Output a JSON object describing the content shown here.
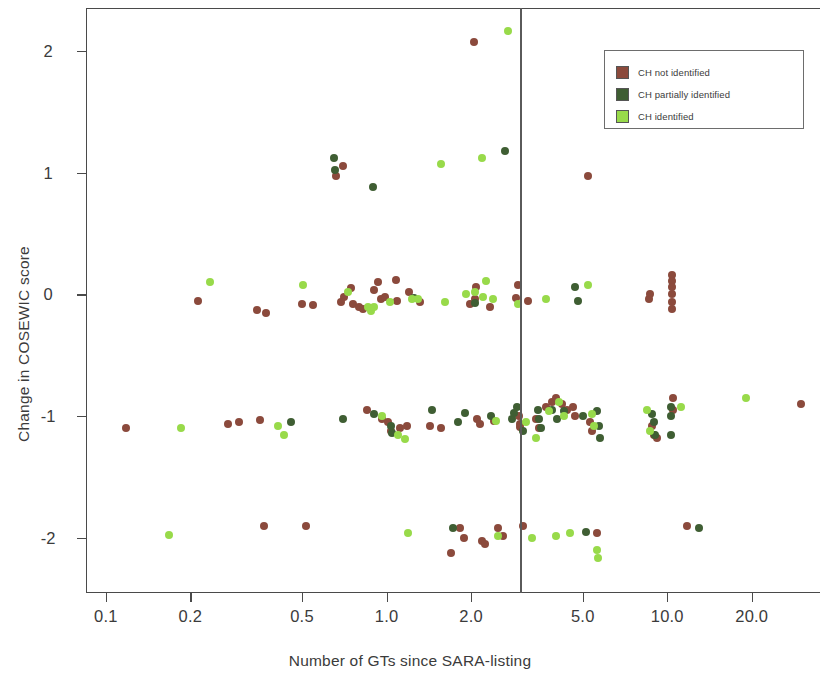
{
  "chart_data": {
    "type": "scatter",
    "title": "",
    "xlabel": "Number of GTs since SARA-listing",
    "ylabel": "Change in COSEWIC score",
    "x_scale": "log",
    "xlim": [
      0.085,
      35.0
    ],
    "ylim": [
      -2.45,
      2.35
    ],
    "grid": false,
    "x_ticks": [
      0.1,
      0.2,
      0.5,
      1.0,
      2.0,
      5.0,
      10.0,
      20.0
    ],
    "x_tick_labels": [
      "0.1",
      "0.2",
      "0.5",
      "1.0",
      "2.0",
      "5.0",
      "10.0",
      "20.0"
    ],
    "y_ticks": [
      2,
      1,
      0,
      -1,
      -2
    ],
    "y_tick_labels": [
      "2",
      "1",
      "0",
      "-1",
      "-2"
    ],
    "annotations": [
      {
        "type": "vline",
        "x": 3.0,
        "color": "#5a5a5a",
        "label": ""
      }
    ],
    "legend": {
      "position": "top-right",
      "entries": [
        {
          "name": "CH not identified",
          "color": "#8B4A3C"
        },
        {
          "name": "CH partially identified",
          "color": "#3F5E33"
        },
        {
          "name": "CH identified",
          "color": "#98DA4A"
        }
      ]
    },
    "series": [
      {
        "name": "CH not identified",
        "color": "#8B4A3C",
        "points": [
          [
            0.118,
            -1.1
          ],
          [
            0.213,
            -0.05
          ],
          [
            0.297,
            -1.05
          ],
          [
            0.345,
            -0.13
          ],
          [
            0.372,
            -0.15
          ],
          [
            0.355,
            -1.03
          ],
          [
            0.365,
            -1.9
          ],
          [
            0.272,
            -1.06
          ],
          [
            0.5,
            -0.08
          ],
          [
            0.545,
            -0.09
          ],
          [
            0.515,
            -1.9
          ],
          [
            0.66,
            0.97
          ],
          [
            0.7,
            1.05
          ],
          [
            0.705,
            -0.02
          ],
          [
            0.745,
            0.05
          ],
          [
            0.76,
            -0.08
          ],
          [
            0.69,
            -0.06
          ],
          [
            0.8,
            -0.1
          ],
          [
            0.825,
            -0.12
          ],
          [
            0.855,
            -0.95
          ],
          [
            0.905,
            0.04
          ],
          [
            0.93,
            0.1
          ],
          [
            0.955,
            -0.04
          ],
          [
            0.985,
            -0.02
          ],
          [
            0.96,
            -1.02
          ],
          [
            1.01,
            -1.05
          ],
          [
            1.04,
            -1.12
          ],
          [
            1.08,
            0.12
          ],
          [
            1.09,
            -0.05
          ],
          [
            1.12,
            -1.1
          ],
          [
            1.18,
            -1.08
          ],
          [
            1.2,
            0.02
          ],
          [
            1.32,
            -0.06
          ],
          [
            1.43,
            -1.08
          ],
          [
            1.56,
            -1.1
          ],
          [
            1.7,
            -2.12
          ],
          [
            1.83,
            -1.92
          ],
          [
            1.88,
            -2.0
          ],
          [
            1.99,
            -0.08
          ],
          [
            2.05,
            2.07
          ],
          [
            2.06,
            -0.04
          ],
          [
            2.09,
            0.06
          ],
          [
            2.1,
            -1.02
          ],
          [
            2.15,
            -1.06
          ],
          [
            2.18,
            -2.02
          ],
          [
            2.24,
            -2.05
          ],
          [
            2.33,
            -0.1
          ],
          [
            2.42,
            -1.04
          ],
          [
            2.5,
            -1.92
          ],
          [
            2.6,
            -1.98
          ],
          [
            2.88,
            -0.03
          ],
          [
            2.95,
            0.08
          ],
          [
            2.96,
            -1.0
          ],
          [
            2.98,
            -1.06
          ],
          [
            3.0,
            -1.09
          ],
          [
            3.05,
            -1.9
          ],
          [
            3.2,
            -0.05
          ],
          [
            3.4,
            -1.02
          ],
          [
            3.5,
            -1.1
          ],
          [
            3.7,
            -0.92
          ],
          [
            3.9,
            -0.88
          ],
          [
            4.0,
            -0.85
          ],
          [
            4.2,
            -0.9
          ],
          [
            4.4,
            -0.95
          ],
          [
            4.6,
            -0.92
          ],
          [
            4.7,
            -1.0
          ],
          [
            5.2,
            0.97
          ],
          [
            5.3,
            -1.05
          ],
          [
            5.4,
            -1.12
          ],
          [
            5.6,
            -1.96
          ],
          [
            8.6,
            -0.04
          ],
          [
            8.7,
            0.0
          ],
          [
            8.8,
            -1.08
          ],
          [
            9.0,
            -1.15
          ],
          [
            9.2,
            -1.18
          ],
          [
            10.4,
            0.16
          ],
          [
            10.4,
            0.11
          ],
          [
            10.4,
            0.06
          ],
          [
            10.4,
            0.0
          ],
          [
            10.4,
            -0.06
          ],
          [
            10.4,
            -0.12
          ],
          [
            10.45,
            -0.85
          ],
          [
            10.45,
            -0.95
          ],
          [
            11.8,
            -1.9
          ],
          [
            30.0,
            -0.9
          ]
        ]
      },
      {
        "name": "CH partially identified",
        "color": "#3F5E33",
        "points": [
          [
            0.455,
            -1.05
          ],
          [
            0.65,
            1.12
          ],
          [
            0.655,
            1.02
          ],
          [
            0.7,
            -1.02
          ],
          [
            0.895,
            0.88
          ],
          [
            0.905,
            -0.98
          ],
          [
            1.04,
            -1.08
          ],
          [
            1.05,
            -1.14
          ],
          [
            1.25,
            -0.03
          ],
          [
            1.45,
            -0.95
          ],
          [
            1.72,
            -1.92
          ],
          [
            1.8,
            -1.05
          ],
          [
            1.9,
            -0.97
          ],
          [
            2.06,
            -0.07
          ],
          [
            2.35,
            -1.0
          ],
          [
            2.65,
            1.18
          ],
          [
            2.8,
            -1.02
          ],
          [
            2.85,
            -0.97
          ],
          [
            2.92,
            -0.92
          ],
          [
            3.05,
            -1.12
          ],
          [
            3.45,
            -0.95
          ],
          [
            3.5,
            -1.02
          ],
          [
            3.55,
            -1.1
          ],
          [
            3.9,
            -0.95
          ],
          [
            4.05,
            -1.02
          ],
          [
            4.3,
            -0.96
          ],
          [
            4.7,
            0.06
          ],
          [
            4.8,
            -0.05
          ],
          [
            5.0,
            -1.0
          ],
          [
            5.15,
            -1.95
          ],
          [
            5.6,
            -0.96
          ],
          [
            5.7,
            -1.08
          ],
          [
            5.75,
            -1.18
          ],
          [
            8.8,
            -0.98
          ],
          [
            9.0,
            -1.05
          ],
          [
            9.05,
            -1.15
          ],
          [
            10.3,
            -0.92
          ],
          [
            10.3,
            -1.0
          ],
          [
            10.35,
            -1.15
          ],
          [
            13.0,
            -1.92
          ]
        ]
      },
      {
        "name": "CH identified",
        "color": "#98DA4A",
        "points": [
          [
            0.168,
            -1.97
          ],
          [
            0.185,
            -1.1
          ],
          [
            0.235,
            0.1
          ],
          [
            0.412,
            -1.08
          ],
          [
            0.43,
            -1.15
          ],
          [
            0.505,
            0.08
          ],
          [
            0.73,
            0.02
          ],
          [
            0.86,
            -0.1
          ],
          [
            0.88,
            -0.14
          ],
          [
            0.905,
            -0.1
          ],
          [
            0.96,
            -1.0
          ],
          [
            1.03,
            -0.06
          ],
          [
            1.1,
            -1.15
          ],
          [
            1.16,
            -1.19
          ],
          [
            1.19,
            -1.96
          ],
          [
            1.23,
            -0.04
          ],
          [
            1.29,
            -0.04
          ],
          [
            1.56,
            1.07
          ],
          [
            1.62,
            -0.06
          ],
          [
            1.92,
            0.0
          ],
          [
            2.06,
            0.02
          ],
          [
            2.18,
            1.12
          ],
          [
            2.2,
            -0.02
          ],
          [
            2.26,
            0.11
          ],
          [
            2.4,
            -0.04
          ],
          [
            2.46,
            -1.04
          ],
          [
            2.5,
            -1.98
          ],
          [
            2.7,
            2.16
          ],
          [
            2.95,
            -0.08
          ],
          [
            3.15,
            -1.05
          ],
          [
            3.3,
            -2.0
          ],
          [
            3.4,
            -1.18
          ],
          [
            3.7,
            -0.04
          ],
          [
            3.8,
            -0.96
          ],
          [
            4.0,
            -1.98
          ],
          [
            4.1,
            -0.88
          ],
          [
            4.3,
            -1.0
          ],
          [
            4.5,
            -1.96
          ],
          [
            5.2,
            0.08
          ],
          [
            5.4,
            -0.98
          ],
          [
            5.5,
            -1.08
          ],
          [
            5.6,
            -2.1
          ],
          [
            5.65,
            -2.16
          ],
          [
            8.5,
            -0.95
          ],
          [
            8.7,
            -1.12
          ],
          [
            11.2,
            -0.92
          ],
          [
            19.0,
            -0.85
          ]
        ]
      }
    ]
  }
}
